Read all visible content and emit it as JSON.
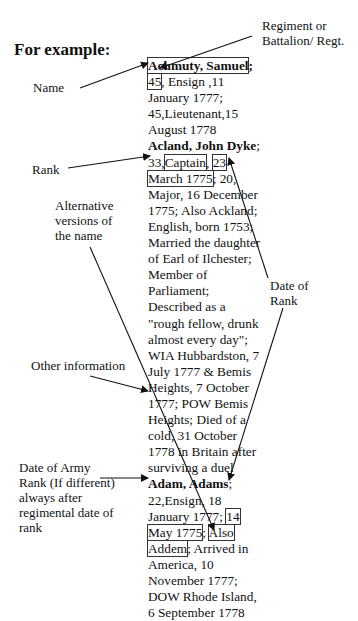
{
  "heading": "For example:",
  "labels": {
    "regiment": [
      "Regiment or",
      "Battalion/ Regt."
    ],
    "name": "Name",
    "rank": "Rank",
    "alternative": [
      "Alternative",
      "versions of",
      "the name"
    ],
    "date_of_rank": [
      "Date of",
      "Rank"
    ],
    "other_info": "Other information",
    "date_of_army": [
      "Date of Army",
      "Rank (If different)",
      "always after",
      "regimental date of",
      "rank"
    ]
  },
  "entries": [
    {
      "name": "Achmuty, Samuel",
      "regiment": "45",
      "line1_rest": ", Ensign ,11",
      "lines": [
        "January 1777;",
        "45,Lieutenant,15",
        "August 1778"
      ]
    },
    {
      "name": "Acland, John Dyke",
      "regiment_prefix": "33,",
      "rank": "Captain",
      "date_part1": "23",
      "date_part2": "March 1775",
      "after_date": "; 20,",
      "lines": [
        "Major, 16 December",
        "1775; Also Ackland;",
        "English, born 1753;",
        "Married the daughter",
        "of Earl of Ilchester;",
        "Member of",
        "Parliament;",
        "Described as a",
        "\"rough fellow, drunk",
        "almost every day\";",
        "WIA Hubbardston, 7",
        "July 1777 & Bemis",
        "Heights, 7 October",
        "1777; POW Bemis",
        "Heights; Died of a",
        "cold, 31 October",
        "1778 in Britain after",
        "surviving a duel"
      ]
    },
    {
      "name": "Adam, Adams",
      "line1": "22,Ensign, 18",
      "line2_pre": "January 1777; ",
      "army_date1": "14",
      "army_date2": "May 1775",
      "alt_sep": "; ",
      "alt1": "Also",
      "alt2": "Addem",
      "alt_rest": "; Arrived in",
      "lines": [
        "America, 10",
        "November 1777;",
        "DOW Rhode Island,",
        "6 September 1778"
      ]
    }
  ]
}
